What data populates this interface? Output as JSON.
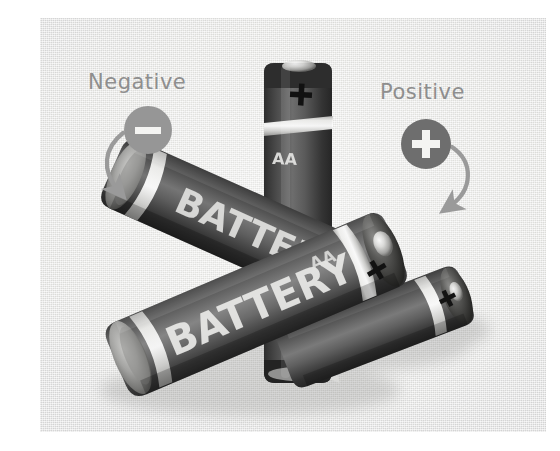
{
  "figure": {
    "background_color": "#ffffff",
    "plate_color": "#ececea"
  },
  "annotations": [
    {
      "id": "negative",
      "label": "Negative",
      "symbol": "minus",
      "badge_color": "#969696",
      "label_color": "#8e8e8e",
      "arrow_color": "#9a9a9a",
      "points_to": "flat-terminal-left-battery"
    },
    {
      "id": "positive",
      "label": "Positive",
      "symbol": "plus",
      "badge_color": "#6e6e6e",
      "label_color": "#8e8e8e",
      "arrow_color": "#9a9a9a",
      "points_to": "nub-terminal-right-battery"
    }
  ],
  "batteries": [
    {
      "id": "vertical-center",
      "orientation": "vertical",
      "brand_text": "BATTERY",
      "size_text": "AA",
      "terminal_top": "+",
      "terminal_bottom": "-",
      "body_color": "#3d3d3d",
      "band_color": "#e2e2e0"
    },
    {
      "id": "diagonal-upper-left",
      "orientation": "diagonal-down-right",
      "brand_text": "BATTERY",
      "size_text": "AA",
      "terminal_left": "-",
      "terminal_right": "+",
      "body_color": "#4a4a4a",
      "band_color": "#dcdcda"
    },
    {
      "id": "diagonal-lower-left",
      "orientation": "diagonal-up-right",
      "brand_text": "BATTERY",
      "size_text": "AA",
      "terminal_left": "-",
      "terminal_right": "+",
      "body_color": "#5a5a5a",
      "band_color": "#e0e0de"
    },
    {
      "id": "diagonal-lower-right",
      "orientation": "diagonal-up-right",
      "brand_text": "",
      "size_text": "",
      "terminal_right": "+",
      "body_color": "#4d4d4d",
      "band_color": "#dedede"
    }
  ],
  "terminal_symbols": {
    "plus": "+",
    "minus": "-"
  }
}
